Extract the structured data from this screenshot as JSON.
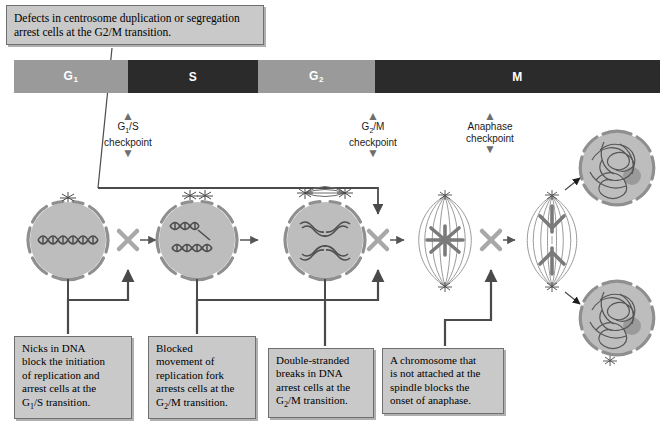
{
  "figure": {
    "callout": "Defects in centrosome duplication or segregation arrest cells at the G2/M transition."
  },
  "phase_bar": {
    "segments": [
      {
        "label": "G",
        "sub": "1",
        "tone": "light",
        "left": 0,
        "width": 114
      },
      {
        "label": "S",
        "sub": "",
        "tone": "dark",
        "left": 114,
        "width": 130
      },
      {
        "label": "G",
        "sub": "2",
        "tone": "light",
        "left": 244,
        "width": 117
      },
      {
        "label": "M",
        "sub": "",
        "tone": "dark",
        "left": 361,
        "width": 285
      }
    ]
  },
  "checkpoints": [
    {
      "name": "g1-s",
      "label": "G",
      "sub": "1",
      "label2": "/S",
      "line2": "checkpoint",
      "left": 73,
      "top": 112
    },
    {
      "name": "g2-m",
      "label": "G",
      "sub": "2",
      "label2": "/M",
      "line2": "checkpoint",
      "left": 318,
      "top": 112
    },
    {
      "name": "anaphase",
      "label": "Anaphase",
      "sub": "",
      "label2": "",
      "line2": "checkpoint",
      "left": 435,
      "top": 112
    }
  ],
  "arrow_glyphs": {
    "up": "▲",
    "down": "▼"
  },
  "captions": [
    {
      "name": "nicks-in-dna",
      "left": 14,
      "top": 336,
      "width": 118,
      "lines": [
        {
          "text": "Nicks in DNA"
        },
        {
          "text": "block the initiation"
        },
        {
          "text": "of replication and"
        },
        {
          "text": "arrest cells at the"
        },
        {
          "text": "G",
          "sub": "1",
          "tail": "/S transition."
        }
      ]
    },
    {
      "name": "blocked-replication-fork",
      "left": 148,
      "top": 336,
      "width": 108,
      "lines": [
        {
          "text": "Blocked"
        },
        {
          "text": "movement of"
        },
        {
          "text": "replication fork"
        },
        {
          "text": "arrests cells at the"
        },
        {
          "text": "G",
          "sub": "2",
          "tail": "/M transition."
        }
      ]
    },
    {
      "name": "double-stranded-breaks",
      "left": 268,
      "top": 348,
      "width": 106,
      "lines": [
        {
          "text": "Double-stranded"
        },
        {
          "text": "breaks in DNA"
        },
        {
          "text": "arrest cells at the"
        },
        {
          "text": "G",
          "sub": "2",
          "tail": "/M transition."
        }
      ]
    },
    {
      "name": "unattached-chromosome",
      "left": 382,
      "top": 348,
      "width": 122,
      "lines": [
        {
          "text": "A chromosome that"
        },
        {
          "text": "is not attached at the"
        },
        {
          "text": "spindle blocks the"
        },
        {
          "text": "onset of anaphase."
        }
      ]
    }
  ],
  "colors": {
    "phase_light": "#9a9a9a",
    "phase_dark": "#2b2b2b",
    "caption_fill": "#c9c9c9",
    "caption_border": "#6f6f6f",
    "cell_fill": "#bdbdbd",
    "connector": "#4a4a4a",
    "block_x": "#a8a8a8"
  },
  "cells": [
    {
      "name": "g1-cell",
      "cx": 68,
      "cy": 240,
      "r": 40,
      "stage": "G1 interphase, single centrosome, decondensed DNA"
    },
    {
      "name": "s-cell",
      "cx": 197,
      "cy": 240,
      "r": 40,
      "stage": "S phase, duplicated centrosomes, replicating DNA"
    },
    {
      "name": "g2-cell",
      "cx": 325,
      "cy": 240,
      "r": 40,
      "stage": "G2 phase, separated centrosomes, replicated X chromosome"
    },
    {
      "name": "metaphase-cell",
      "cx": 445,
      "cy": 240,
      "r": 40,
      "stage": "Metaphase spindle with aligned chromosomes"
    },
    {
      "name": "anaphase-cell",
      "cx": 552,
      "cy": 240,
      "r": 40,
      "stage": "Anaphase, chromosomes moving to poles"
    },
    {
      "name": "daughter-cell-top",
      "cx": 617,
      "cy": 168,
      "r": 38,
      "stage": "Daughter cell with decondensed chromatin and nucleolus"
    },
    {
      "name": "daughter-cell-bottom",
      "cx": 617,
      "cy": 318,
      "r": 38,
      "stage": "Daughter cell with decondensed chromatin and nucleolus"
    }
  ],
  "blocks": [
    {
      "name": "block-g1-s",
      "cx": 128,
      "cy": 240
    },
    {
      "name": "block-g2-m",
      "cx": 378,
      "cy": 240
    },
    {
      "name": "block-anaphase",
      "cx": 491,
      "cy": 240
    }
  ]
}
